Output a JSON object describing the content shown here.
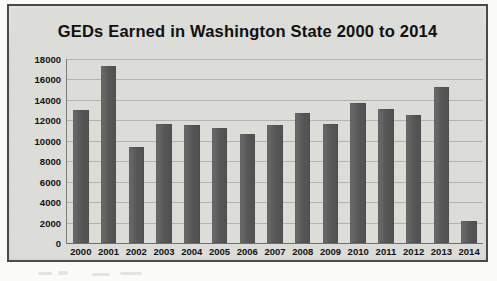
{
  "chart_data": {
    "type": "bar",
    "title": "GEDs Earned in Washington State 2000 to 2014",
    "xlabel": "",
    "ylabel": "",
    "categories": [
      "2000",
      "2001",
      "2002",
      "2003",
      "2004",
      "2005",
      "2006",
      "2007",
      "2008",
      "2009",
      "2010",
      "2011",
      "2012",
      "2013",
      "2014"
    ],
    "values": [
      13000,
      17300,
      9400,
      11600,
      11550,
      11300,
      10700,
      11550,
      12700,
      11650,
      13650,
      13100,
      12500,
      15250,
      2200
    ],
    "ylim": [
      0,
      18000
    ],
    "yticks": [
      0,
      2000,
      4000,
      6000,
      8000,
      10000,
      12000,
      14000,
      16000,
      18000
    ],
    "ytick_labels": [
      "0",
      "2000",
      "4000",
      "6000",
      "8000",
      "10000",
      "12000",
      "14000",
      "16000",
      "18000"
    ],
    "grid": true,
    "legend": false,
    "series": [
      {
        "name": "GEDs Earned",
        "values": [
          13000,
          17300,
          9400,
          11600,
          11550,
          11300,
          10700,
          11550,
          12700,
          11650,
          13650,
          13100,
          12500,
          15250,
          2200
        ]
      }
    ]
  },
  "style": {
    "bar_color": "#5b5b5b",
    "plot_background": "#dcdcd9",
    "grid_color": "#b3b3ae",
    "axis_color": "#7a7a76",
    "text_color": "#111111",
    "frame_color": "#4a4a4a",
    "page_background": "#fbfbfa"
  }
}
